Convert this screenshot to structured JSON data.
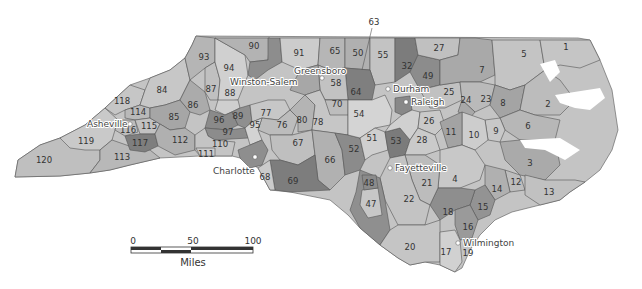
{
  "map": {
    "title_cropped": "",
    "region": "North Carolina",
    "shade_colors": {
      "light": "#d2d2d2",
      "mid_light": "#bdbdbd",
      "mid": "#a8a8a8",
      "dark": "#8a8a8a",
      "darkest": "#6f6f6f"
    },
    "cities": [
      {
        "name": "Asheville",
        "x": 130,
        "y": 124
      },
      {
        "name": "Winston-Salem",
        "x": 295,
        "y": 82
      },
      {
        "name": "Greensboro",
        "x": 322,
        "y": 78
      },
      {
        "name": "Durham",
        "x": 388,
        "y": 89
      },
      {
        "name": "Raleigh",
        "x": 406,
        "y": 102
      },
      {
        "name": "Charlotte",
        "x": 255,
        "y": 157
      },
      {
        "name": "Fayetteville",
        "x": 390,
        "y": 168
      },
      {
        "name": "Wilmington",
        "x": 458,
        "y": 243
      }
    ],
    "district_labels": [
      {
        "n": "1",
        "x": 566,
        "y": 47
      },
      {
        "n": "2",
        "x": 548,
        "y": 104
      },
      {
        "n": "3",
        "x": 530,
        "y": 163
      },
      {
        "n": "4",
        "x": 455,
        "y": 179
      },
      {
        "n": "5",
        "x": 524,
        "y": 54
      },
      {
        "n": "6",
        "x": 528,
        "y": 126
      },
      {
        "n": "7",
        "x": 482,
        "y": 70
      },
      {
        "n": "8",
        "x": 503,
        "y": 103
      },
      {
        "n": "9",
        "x": 496,
        "y": 131
      },
      {
        "n": "10",
        "x": 474,
        "y": 135
      },
      {
        "n": "11",
        "x": 451,
        "y": 132
      },
      {
        "n": "12",
        "x": 516,
        "y": 182
      },
      {
        "n": "13",
        "x": 549,
        "y": 192
      },
      {
        "n": "14",
        "x": 497,
        "y": 189
      },
      {
        "n": "15",
        "x": 483,
        "y": 207
      },
      {
        "n": "16",
        "x": 468,
        "y": 227
      },
      {
        "n": "17",
        "x": 446,
        "y": 252
      },
      {
        "n": "18",
        "x": 448,
        "y": 212
      },
      {
        "n": "19",
        "x": 468,
        "y": 253
      },
      {
        "n": "20",
        "x": 410,
        "y": 247
      },
      {
        "n": "21",
        "x": 427,
        "y": 183
      },
      {
        "n": "22",
        "x": 409,
        "y": 199
      },
      {
        "n": "23",
        "x": 486,
        "y": 99
      },
      {
        "n": "24",
        "x": 466,
        "y": 100
      },
      {
        "n": "25",
        "x": 449,
        "y": 92
      },
      {
        "n": "26",
        "x": 429,
        "y": 121
      },
      {
        "n": "27",
        "x": 439,
        "y": 48
      },
      {
        "n": "28",
        "x": 422,
        "y": 140
      },
      {
        "n": "32",
        "x": 407,
        "y": 66
      },
      {
        "n": "47",
        "x": 371,
        "y": 204
      },
      {
        "n": "48",
        "x": 369,
        "y": 183
      },
      {
        "n": "49",
        "x": 428,
        "y": 76
      },
      {
        "n": "50",
        "x": 358,
        "y": 53
      },
      {
        "n": "51",
        "x": 372,
        "y": 138
      },
      {
        "n": "52",
        "x": 354,
        "y": 149
      },
      {
        "n": "53",
        "x": 396,
        "y": 141
      },
      {
        "n": "54",
        "x": 359,
        "y": 114
      },
      {
        "n": "55",
        "x": 383,
        "y": 55
      },
      {
        "n": "58",
        "x": 336,
        "y": 83
      },
      {
        "n": "63",
        "x": 374,
        "y": 22
      },
      {
        "n": "64",
        "x": 356,
        "y": 92
      },
      {
        "n": "65",
        "x": 335,
        "y": 51
      },
      {
        "n": "66",
        "x": 330,
        "y": 160
      },
      {
        "n": "67",
        "x": 298,
        "y": 143
      },
      {
        "n": "68",
        "x": 265,
        "y": 177
      },
      {
        "n": "69",
        "x": 293,
        "y": 181
      },
      {
        "n": "70",
        "x": 337,
        "y": 104
      },
      {
        "n": "76",
        "x": 282,
        "y": 125
      },
      {
        "n": "77",
        "x": 266,
        "y": 113
      },
      {
        "n": "78",
        "x": 318,
        "y": 122
      },
      {
        "n": "80",
        "x": 302,
        "y": 120
      },
      {
        "n": "84",
        "x": 162,
        "y": 90
      },
      {
        "n": "85",
        "x": 174,
        "y": 117
      },
      {
        "n": "86",
        "x": 193,
        "y": 105
      },
      {
        "n": "87",
        "x": 211,
        "y": 89
      },
      {
        "n": "88",
        "x": 230,
        "y": 93
      },
      {
        "n": "89",
        "x": 238,
        "y": 116
      },
      {
        "n": "90",
        "x": 254,
        "y": 46
      },
      {
        "n": "91",
        "x": 299,
        "y": 53
      },
      {
        "n": "93",
        "x": 204,
        "y": 57
      },
      {
        "n": "94",
        "x": 229,
        "y": 68
      },
      {
        "n": "95",
        "x": 255,
        "y": 125
      },
      {
        "n": "96",
        "x": 219,
        "y": 120
      },
      {
        "n": "97",
        "x": 228,
        "y": 132
      },
      {
        "n": "110",
        "x": 220,
        "y": 144
      },
      {
        "n": "111",
        "x": 206,
        "y": 154
      },
      {
        "n": "112",
        "x": 180,
        "y": 140
      },
      {
        "n": "113",
        "x": 122,
        "y": 157
      },
      {
        "n": "114",
        "x": 138,
        "y": 112
      },
      {
        "n": "115",
        "x": 149,
        "y": 126
      },
      {
        "n": "116",
        "x": 128,
        "y": 130
      },
      {
        "n": "117",
        "x": 140,
        "y": 143
      },
      {
        "n": "118",
        "x": 122,
        "y": 101
      },
      {
        "n": "119",
        "x": 86,
        "y": 141
      },
      {
        "n": "120",
        "x": 44,
        "y": 160
      }
    ]
  },
  "scale_bar": {
    "ticks": [
      "0",
      "50",
      "100"
    ],
    "unit": "Miles"
  }
}
